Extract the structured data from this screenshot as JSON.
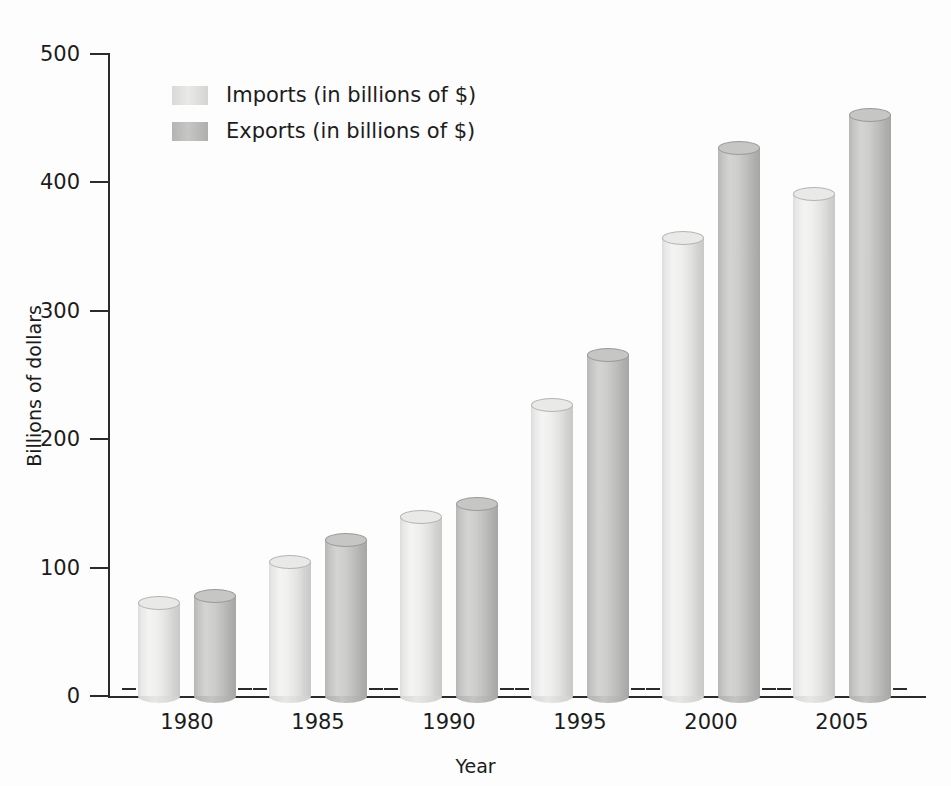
{
  "chart_data": {
    "type": "bar",
    "title": "",
    "subtitle": "",
    "xlabel": "Year",
    "ylabel": "Billions of dollars",
    "categories": [
      "1980",
      "1985",
      "1990",
      "1995",
      "2000",
      "2005"
    ],
    "series": [
      {
        "name": "Imports (in billions of $)",
        "values": [
          72,
          104,
          139,
          226,
          356,
          390
        ],
        "color": "#e9e9e8"
      },
      {
        "name": "Exports (in billions of $)",
        "values": [
          78,
          121,
          149,
          265,
          426,
          452
        ],
        "color": "#c6c6c5"
      }
    ],
    "ylim": [
      0,
      500
    ],
    "yticks": [
      0,
      100,
      200,
      300,
      400,
      500
    ],
    "ytick_labels": [
      "0",
      "100",
      "200",
      "300",
      "400",
      "500"
    ],
    "grid": false,
    "legend_position": "upper-left",
    "bar_style": "3d-cylinder"
  },
  "axes": {
    "y_title": "Billions of dollars",
    "x_title": "Year",
    "y_tick_labels": [
      "500",
      "400",
      "300",
      "200",
      "100",
      "0"
    ],
    "x_tick_labels": [
      "1980",
      "1985",
      "1990",
      "1995",
      "2000",
      "2005"
    ]
  },
  "legend": {
    "items": [
      {
        "label": "Imports (in billions of $)",
        "swatch": "sw-imports"
      },
      {
        "label": "Exports (in billions of $)",
        "swatch": "sw-exports"
      }
    ]
  }
}
